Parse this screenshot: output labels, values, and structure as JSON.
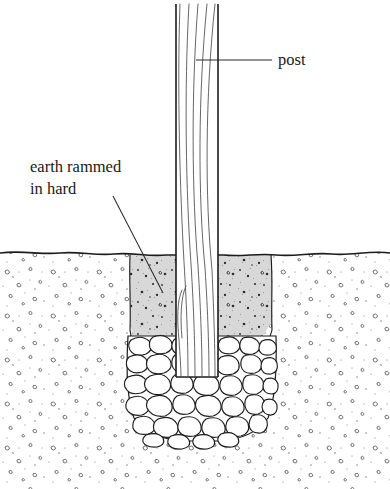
{
  "figure": {
    "background_color": "#ffffff",
    "width": 390,
    "height": 489
  },
  "labels": [
    {
      "id": "post",
      "text": "post",
      "x": 278,
      "y": 61,
      "anchor": "start",
      "leader": {
        "x1": 196,
        "y1": 60,
        "x2": 272,
        "y2": 60
      }
    },
    {
      "id": "earth-rammed-in-hard",
      "line1": "earth rammed",
      "line2": "in hard",
      "x": 30,
      "y1": 168,
      "y2": 190,
      "anchor": "start",
      "leader": {
        "x1": 113,
        "y1": 196,
        "x2": 163,
        "y2": 293
      }
    }
  ],
  "elements": {
    "post": {
      "name": "timber post",
      "left": 176,
      "right": 218,
      "top": 4,
      "fill": "#ffffff",
      "edge_color": "#1c1c1c",
      "grain_color": "#4a4a4a",
      "grain_line_count": 6,
      "bottom_rests_on": "stone bed"
    },
    "ground_line": {
      "name": "ground surface",
      "y": 253,
      "color": "#1c1c1c",
      "style": "wavy"
    },
    "soil": {
      "name": "undisturbed soil",
      "fill": "#ffffff",
      "texture": "sparse pebble stipple",
      "speck_color": "#555555",
      "top": 253,
      "bottom": 489
    },
    "backfill": {
      "name": "earth rammed in hard",
      "fill": "#d8d8d8",
      "texture": "dense dark speckle",
      "speck_color": "#2e2e2e",
      "trench_left": 130,
      "trench_right": 272,
      "top": 255,
      "bottom": 360
    },
    "stone_bed": {
      "name": "packed stone bed",
      "fill": "#ffffff",
      "stroke": "#1c1c1c",
      "top": 333,
      "bottom": 441,
      "left": 126,
      "right": 276,
      "shape": "rounded-u",
      "stone_count": 58
    }
  },
  "colors": {
    "ink": "#1c1c1c",
    "backfill_gray": "#d8d8d8",
    "paper": "#ffffff",
    "leader": "#2b2b2b"
  }
}
